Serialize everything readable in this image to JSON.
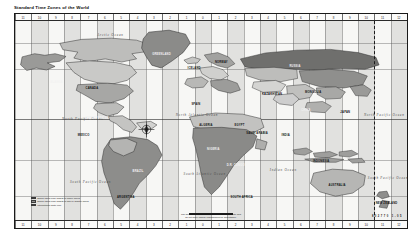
{
  "document": {
    "title": "Standard Time Zones of the World",
    "frame_border_color": "#1a1a1a",
    "page_background": "#ffffff",
    "map_background": "#f7f7f5",
    "zone_band_color": "#787878",
    "land_outline_color": "#2b2b2b"
  },
  "rulers": {
    "top_labels": [
      "11",
      "10",
      "9",
      "8",
      "7",
      "6",
      "5",
      "4",
      "3",
      "2",
      "1",
      "0",
      "1",
      "2",
      "3",
      "4",
      "5",
      "6",
      "7",
      "8",
      "9",
      "10",
      "11",
      "12"
    ],
    "bottom_labels": [
      "11",
      "10",
      "9",
      "8",
      "7",
      "6",
      "5",
      "4",
      "3",
      "2",
      "1",
      "0",
      "1",
      "2",
      "3",
      "4",
      "5",
      "6",
      "7",
      "8",
      "9",
      "10",
      "11",
      "12"
    ]
  },
  "ocean_labels": [
    {
      "name": "Arctic Ocean",
      "x": 21,
      "y": 6,
      "size": 3.3
    },
    {
      "name": "North Pacific Ocean",
      "x": 12,
      "y": 48,
      "size": 3.3
    },
    {
      "name": "North Atlantic Ocean",
      "x": 41,
      "y": 46,
      "size": 3.2
    },
    {
      "name": "South Pacific Ocean",
      "x": 14,
      "y": 80,
      "size": 3.3
    },
    {
      "name": "South Atlantic Ocean",
      "x": 43,
      "y": 76,
      "size": 3.2
    },
    {
      "name": "Indian Ocean",
      "x": 65,
      "y": 74,
      "size": 3.3
    },
    {
      "name": "North Pacific Ocean",
      "x": 89,
      "y": 46,
      "size": 3.2
    },
    {
      "name": "South Pacific Ocean",
      "x": 90,
      "y": 78,
      "size": 3.2
    }
  ],
  "country_labels": [
    {
      "name": "ALASKA",
      "x": 9,
      "y": 30,
      "light": true
    },
    {
      "name": "CANADA",
      "x": 18,
      "y": 33,
      "light": false
    },
    {
      "name": "UNITED STATES",
      "x": 18,
      "y": 48,
      "light": true
    },
    {
      "name": "GREENLAND",
      "x": 35,
      "y": 16,
      "light": true
    },
    {
      "name": "MEXICO",
      "x": 16,
      "y": 57,
      "light": false
    },
    {
      "name": "BRAZIL",
      "x": 30,
      "y": 75,
      "light": true
    },
    {
      "name": "ARGENTINA",
      "x": 26,
      "y": 88,
      "light": false
    },
    {
      "name": "ICELAND",
      "x": 44,
      "y": 23,
      "light": false
    },
    {
      "name": "NORWAY",
      "x": 51,
      "y": 20,
      "light": false
    },
    {
      "name": "SPAIN",
      "x": 45,
      "y": 41,
      "light": false
    },
    {
      "name": "ALGERIA",
      "x": 47,
      "y": 52,
      "light": false
    },
    {
      "name": "NIGERIA",
      "x": 49,
      "y": 64,
      "light": true
    },
    {
      "name": "D.R. CONGO",
      "x": 54,
      "y": 72,
      "light": true
    },
    {
      "name": "SOUTH AFRICA",
      "x": 55,
      "y": 88,
      "light": false
    },
    {
      "name": "EGYPT",
      "x": 56,
      "y": 52,
      "light": false
    },
    {
      "name": "RUSSIA",
      "x": 70,
      "y": 22,
      "light": true
    },
    {
      "name": "KAZAKHSTAN",
      "x": 63,
      "y": 36,
      "light": false
    },
    {
      "name": "SAUDI ARABIA",
      "x": 59,
      "y": 56,
      "light": false
    },
    {
      "name": "INDIA",
      "x": 68,
      "y": 57,
      "light": false
    },
    {
      "name": "CHINA",
      "x": 73,
      "y": 44,
      "light": true
    },
    {
      "name": "MONGOLIA",
      "x": 74,
      "y": 35,
      "light": false
    },
    {
      "name": "JAPAN",
      "x": 83,
      "y": 45,
      "light": false
    },
    {
      "name": "INDONESIA",
      "x": 76,
      "y": 70,
      "light": false
    },
    {
      "name": "AUSTRALIA",
      "x": 80,
      "y": 82,
      "light": false
    },
    {
      "name": "NEW ZEALAND",
      "x": 92,
      "y": 91,
      "light": false
    }
  ],
  "legend": {
    "rows": [
      {
        "swatch": "#d8d8d6",
        "text": "Zones using UTC offsets of whole hours"
      },
      {
        "swatch": "#8f8f8d",
        "text": "Zones using UTC offsets of half or quarter hours"
      },
      {
        "swatch": "#3a3a3a",
        "text": "International Date Line"
      }
    ]
  },
  "caption": {
    "lines": [
      "The boundaries shown on this map are approximate and",
      "do not imply official endorsement or acceptance."
    ],
    "codes": "802770  1-05"
  },
  "compass": {
    "name": "compass-rose"
  },
  "date_line": {
    "name": "international-date-line"
  }
}
